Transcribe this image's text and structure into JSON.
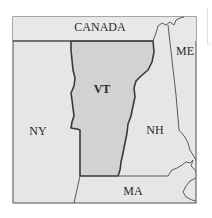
{
  "map": {
    "title": "Vermont and neighboring regions",
    "labels": {
      "canada": "CANADA",
      "maine": "ME",
      "vermont": "VT",
      "new_york": "NY",
      "new_hampshire": "NH",
      "massachusetts": "MA"
    },
    "colors": {
      "background": "#ffffff",
      "land": "#e6e6e6",
      "highlight_state": "#d2d2d2",
      "border": "#5a5a5a",
      "highlight_border": "#3a3a3a",
      "text": "#2a2a2a"
    },
    "highlighted_state": "VT"
  }
}
